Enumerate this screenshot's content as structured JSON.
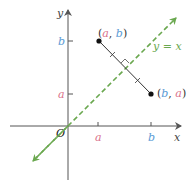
{
  "diagram": {
    "axes": {
      "x_label": "x",
      "y_label": "y",
      "origin_label": "O"
    },
    "ticks": {
      "x": [
        {
          "label": "a",
          "color": "#d9708a"
        },
        {
          "label": "b",
          "color": "#5b9bd5"
        }
      ],
      "y": [
        {
          "label": "a",
          "color": "#d9708a"
        },
        {
          "label": "b",
          "color": "#5b9bd5"
        }
      ]
    },
    "line": {
      "label": "y = x",
      "color": "#6aa84f",
      "style": "dashed"
    },
    "points": [
      {
        "name": "P",
        "label_open": "(",
        "label_x": "a",
        "label_sep": ", ",
        "label_y": "b",
        "label_close": ")"
      },
      {
        "name": "Q",
        "label_open": "(",
        "label_x": "b",
        "label_sep": ", ",
        "label_y": "a",
        "label_close": ")"
      }
    ],
    "colors": {
      "a": "#d9708a",
      "b": "#5b9bd5",
      "axis": "#555555",
      "segment": "#333333",
      "point": "#111111"
    }
  }
}
